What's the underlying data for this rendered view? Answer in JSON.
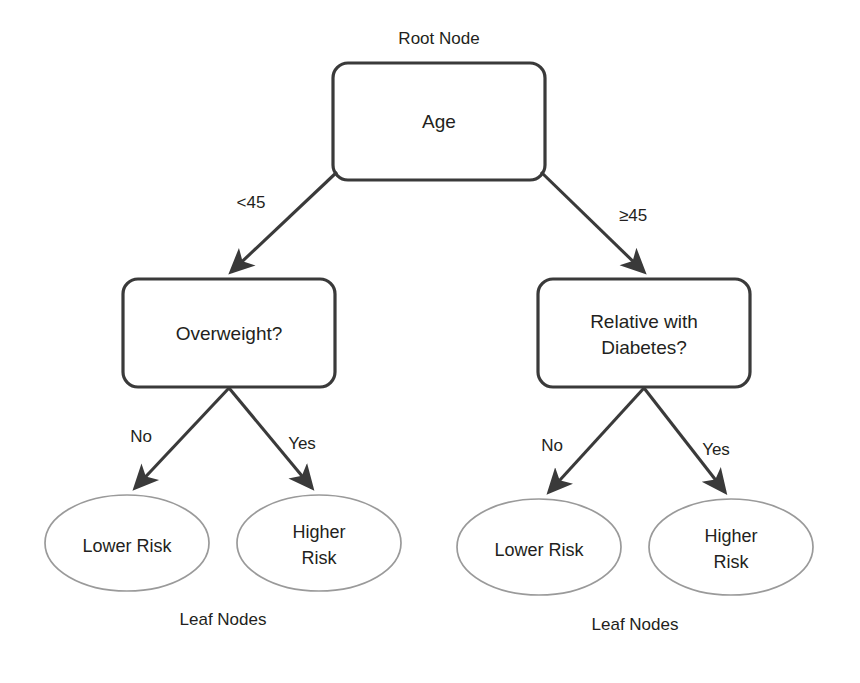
{
  "diagram": {
    "title_caption": "Root Node",
    "leaf_caption_left": "Leaf Nodes",
    "leaf_caption_right": "Leaf Nodes",
    "colors": {
      "decision_stroke": "#3a3a3a",
      "leaf_stroke": "#9a9a9a",
      "edge_stroke": "#3a3a3a",
      "text": "#231f20",
      "background": "#ffffff"
    },
    "nodes": {
      "root": {
        "label": "Age",
        "shape": "rounded-rect"
      },
      "decision_left": {
        "label_line1": "Overweight?",
        "shape": "rounded-rect"
      },
      "decision_right": {
        "label_line1": "Relative with",
        "label_line2": "Diabetes?",
        "shape": "rounded-rect"
      },
      "leaf_1": {
        "label_line1": "Lower Risk",
        "label_line2": "",
        "shape": "ellipse"
      },
      "leaf_2": {
        "label_line1": "Higher",
        "label_line2": "Risk",
        "shape": "ellipse"
      },
      "leaf_3": {
        "label_line1": "Lower Risk",
        "label_line2": "",
        "shape": "ellipse"
      },
      "leaf_4": {
        "label_line1": "Higher",
        "label_line2": "Risk",
        "shape": "ellipse"
      }
    },
    "edges": {
      "root_to_left": "<45",
      "root_to_right": "≥45",
      "left_to_leaf1": "No",
      "left_to_leaf2": "Yes",
      "right_to_leaf3": "No",
      "right_to_leaf4": "Yes"
    }
  }
}
